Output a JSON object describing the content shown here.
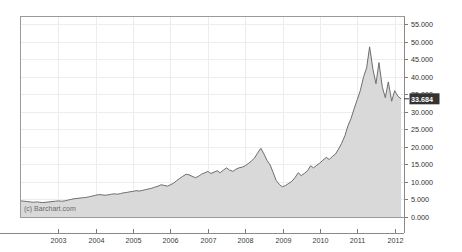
{
  "watermark": "(c) Barchart.com",
  "colors": {
    "line": "#6e6e6e",
    "fill": "#d9d9d9",
    "grid": "#ededed",
    "border": "#9a9a9a",
    "axis_text": "#3a3a3a",
    "highlight_bg": "#333333",
    "highlight_text": "#ffffff"
  },
  "axes": {
    "y_ticks": [
      "55.000",
      "50.000",
      "45.000",
      "40.000",
      "35.000",
      "30.000",
      "25.000",
      "20.000",
      "15.000",
      "10.000",
      "5.000",
      "0.000"
    ],
    "y_tick_values": [
      55,
      50,
      45,
      40,
      35,
      30,
      25,
      20,
      15,
      10,
      5,
      0
    ],
    "x_ticks": [
      "2003",
      "2004",
      "2005",
      "2006",
      "2007",
      "2008",
      "2009",
      "2010",
      "2011",
      "2012"
    ],
    "x_tick_values": [
      2003,
      2004,
      2005,
      2006,
      2007,
      2008,
      2009,
      2010,
      2011,
      2012
    ],
    "y_axis_side": "right",
    "grid": "on"
  },
  "current_value_label": "33.684",
  "chart_data": {
    "type": "area",
    "title": "",
    "subtitle": "",
    "xlabel": "",
    "ylabel": "",
    "xlim": [
      2002.0,
      2012.25
    ],
    "ylim": [
      0,
      57
    ],
    "grid": true,
    "legend": "none",
    "series": [
      {
        "name": "Price",
        "x": [
          2002.0,
          2002.08,
          2002.17,
          2002.25,
          2002.33,
          2002.42,
          2002.5,
          2002.58,
          2002.67,
          2002.75,
          2002.83,
          2002.92,
          2003.0,
          2003.08,
          2003.17,
          2003.25,
          2003.33,
          2003.42,
          2003.5,
          2003.58,
          2003.67,
          2003.75,
          2003.83,
          2003.92,
          2004.0,
          2004.08,
          2004.17,
          2004.25,
          2004.33,
          2004.42,
          2004.5,
          2004.58,
          2004.67,
          2004.75,
          2004.83,
          2004.92,
          2005.0,
          2005.08,
          2005.17,
          2005.25,
          2005.33,
          2005.42,
          2005.5,
          2005.58,
          2005.67,
          2005.75,
          2005.83,
          2005.92,
          2006.0,
          2006.08,
          2006.17,
          2006.25,
          2006.33,
          2006.42,
          2006.5,
          2006.58,
          2006.67,
          2006.75,
          2006.83,
          2006.92,
          2007.0,
          2007.08,
          2007.17,
          2007.25,
          2007.33,
          2007.42,
          2007.5,
          2007.58,
          2007.67,
          2007.75,
          2007.83,
          2007.92,
          2008.0,
          2008.08,
          2008.17,
          2008.25,
          2008.33,
          2008.42,
          2008.5,
          2008.58,
          2008.67,
          2008.75,
          2008.83,
          2008.92,
          2009.0,
          2009.08,
          2009.17,
          2009.25,
          2009.33,
          2009.42,
          2009.5,
          2009.58,
          2009.67,
          2009.75,
          2009.83,
          2009.92,
          2010.0,
          2010.08,
          2010.17,
          2010.25,
          2010.33,
          2010.42,
          2010.5,
          2010.58,
          2010.67,
          2010.75,
          2010.83,
          2010.92,
          2011.0,
          2011.08,
          2011.17,
          2011.25,
          2011.33,
          2011.42,
          2011.5,
          2011.58,
          2011.67,
          2011.75,
          2011.83,
          2011.92,
          2012.0,
          2012.08,
          2012.17
        ],
        "y": [
          4.6,
          4.5,
          4.4,
          4.3,
          4.2,
          4.3,
          4.2,
          4.1,
          4.2,
          4.3,
          4.4,
          4.5,
          4.6,
          4.5,
          4.6,
          4.8,
          5.0,
          5.2,
          5.3,
          5.4,
          5.5,
          5.6,
          5.8,
          6.0,
          6.2,
          6.4,
          6.3,
          6.2,
          6.3,
          6.5,
          6.6,
          6.5,
          6.7,
          6.9,
          7.0,
          7.2,
          7.3,
          7.5,
          7.4,
          7.6,
          7.8,
          8.0,
          8.2,
          8.5,
          8.8,
          9.2,
          9.0,
          8.8,
          9.2,
          9.6,
          10.4,
          11.0,
          11.6,
          12.2,
          12.0,
          11.6,
          11.2,
          11.6,
          12.2,
          12.6,
          13.0,
          12.4,
          12.8,
          13.2,
          12.6,
          13.4,
          14.0,
          13.4,
          13.0,
          13.6,
          14.0,
          14.2,
          14.6,
          15.2,
          16.0,
          16.8,
          18.2,
          19.6,
          18.0,
          16.2,
          14.8,
          12.6,
          10.4,
          9.2,
          8.6,
          9.0,
          9.6,
          10.2,
          11.2,
          12.6,
          11.8,
          12.4,
          13.2,
          14.6,
          14.0,
          14.8,
          15.4,
          16.2,
          17.0,
          16.4,
          17.2,
          18.0,
          19.4,
          21.0,
          23.2,
          26.0,
          28.0,
          31.0,
          33.5,
          36.0,
          40.0,
          42.5,
          48.5,
          42.0,
          38.0,
          44.0,
          37.0,
          34.0,
          38.5,
          33.0,
          36.0,
          34.5,
          33.684
        ]
      }
    ]
  }
}
